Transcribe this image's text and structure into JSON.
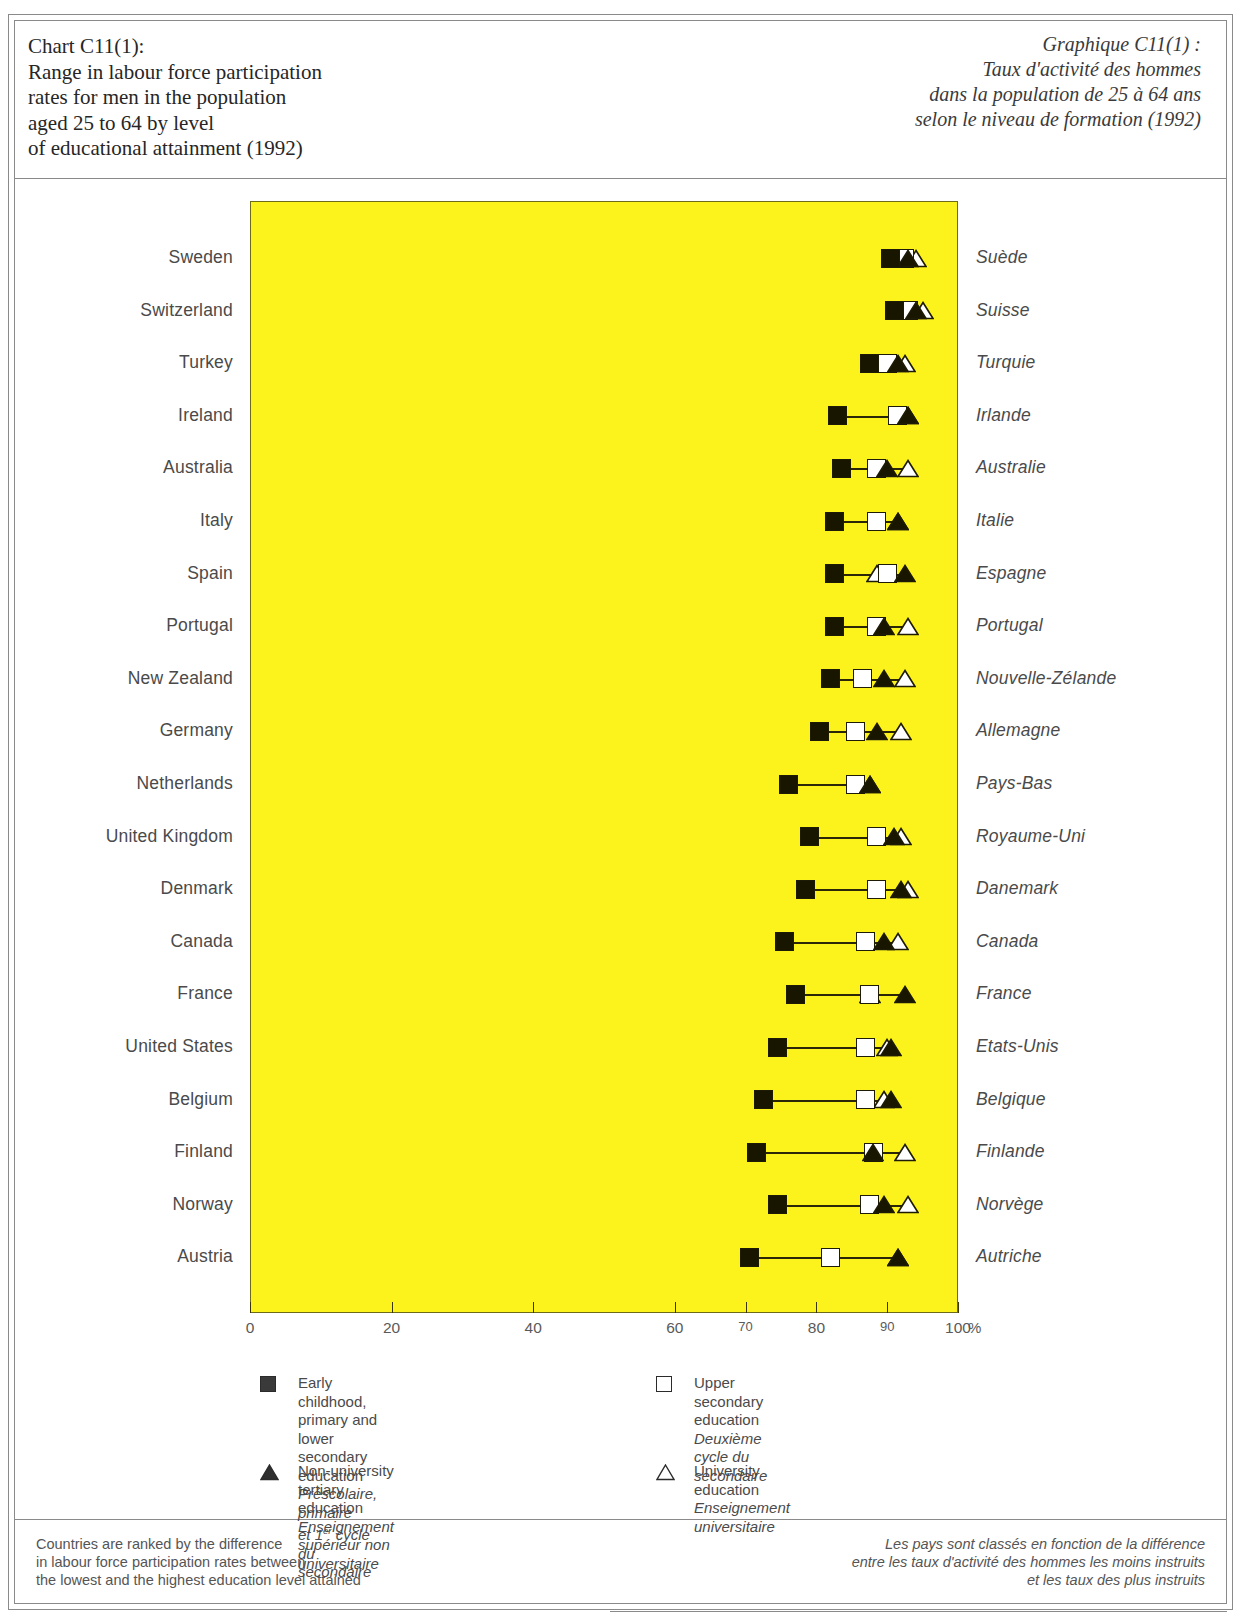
{
  "title_en": "Chart C11(1):\nRange in labour force participation\nrates for men in the population\naged 25 to 64 by level\nof educational attainment (1992)",
  "title_fr": "Graphique C11(1) :\nTaux d'activité des hommes\ndans la population de 25 à 64 ans\nselon le niveau de formation (1992)",
  "axis": {
    "percent_symbol": "%",
    "ticks": [
      {
        "value": 0,
        "label": "0",
        "small": false
      },
      {
        "value": 20,
        "label": "20",
        "small": false
      },
      {
        "value": 40,
        "label": "40",
        "small": false
      },
      {
        "value": 60,
        "label": "60",
        "small": false
      },
      {
        "value": 70,
        "label": "70",
        "small": true
      },
      {
        "value": 80,
        "label": "80",
        "small": false
      },
      {
        "value": 90,
        "label": "90",
        "small": true
      },
      {
        "value": 100,
        "label": "100",
        "small": false
      }
    ]
  },
  "legend": {
    "items": [
      {
        "marker": "filled-square",
        "en": "Early childhood, primary and\nlower secondary education",
        "fr": "Préscolaire, primaire\net 1er cycle du secondaire",
        "fr_sup": "er"
      },
      {
        "marker": "open-square",
        "en": "Upper secondary education",
        "fr": "Deuxième cycle du secondaire"
      },
      {
        "marker": "filled-triangle",
        "en": "Non-university tertiary education",
        "fr": "Enseignement supérieur non universitaire"
      },
      {
        "marker": "open-triangle",
        "en": "University education",
        "fr": "Enseignement universitaire"
      }
    ]
  },
  "note_en": "Countries are ranked by the difference\nin labour force participation rates between\nthe lowest and the highest education level attained",
  "note_fr": "Les pays sont classés en fonction de la différence\nentre les taux d'activité des hommes les moins instruits\net les taux des plus instruits",
  "colors": {
    "plot_background": "#FCF31C",
    "marker_fill": "#191600",
    "marker_open": "#FFFFFF",
    "line": "#2A2607",
    "text": "#4A4A4A"
  },
  "chart_data": {
    "type": "scatter",
    "xlabel": "%",
    "ylabel": "",
    "xlim": [
      0,
      100
    ],
    "grid": false,
    "legend_position": "below",
    "series": [
      {
        "name": "Early childhood, primary and lower secondary education",
        "marker": "filled-square"
      },
      {
        "name": "Upper secondary education",
        "marker": "open-square"
      },
      {
        "name": "Non-university tertiary education",
        "marker": "filled-triangle"
      },
      {
        "name": "University education",
        "marker": "open-triangle"
      }
    ],
    "categories": [
      "Sweden",
      "Switzerland",
      "Turkey",
      "Ireland",
      "Australia",
      "Italy",
      "Spain",
      "Portugal",
      "New Zealand",
      "Germany",
      "Netherlands",
      "United Kingdom",
      "Denmark",
      "Canada",
      "France",
      "United States",
      "Belgium",
      "Finland",
      "Norway",
      "Austria"
    ],
    "categories_fr": [
      "Suède",
      "Suisse",
      "Turquie",
      "Irlande",
      "Australie",
      "Italie",
      "Espagne",
      "Portugal",
      "Nouvelle-Zélande",
      "Allemagne",
      "Pays-Bas",
      "Royaume-Uni",
      "Danemark",
      "Canada",
      "France",
      "Etats-Unis",
      "Belgique",
      "Finlande",
      "Norvège",
      "Autriche"
    ],
    "rows": [
      {
        "country": "Sweden",
        "country_fr": "Suède",
        "lower_secondary": 90.5,
        "upper_secondary": 92.5,
        "non_university": 93.0,
        "university": 94.0
      },
      {
        "country": "Switzerland",
        "country_fr": "Suisse",
        "lower_secondary": 91.0,
        "upper_secondary": 93.0,
        "non_university": 94.0,
        "university": 95.0
      },
      {
        "country": "Turkey",
        "country_fr": "Turquie",
        "lower_secondary": 87.5,
        "upper_secondary": 90.0,
        "non_university": 91.5,
        "university": 92.5
      },
      {
        "country": "Ireland",
        "country_fr": "Irlande",
        "lower_secondary": 83.0,
        "upper_secondary": 91.5,
        "non_university": 93.0,
        "university": 93.0
      },
      {
        "country": "Australia",
        "country_fr": "Australie",
        "lower_secondary": 83.5,
        "upper_secondary": 88.5,
        "non_university": 90.0,
        "university": 93.0
      },
      {
        "country": "Italy",
        "country_fr": "Italie",
        "lower_secondary": 82.5,
        "upper_secondary": 88.5,
        "non_university": 91.5,
        "university": 91.5
      },
      {
        "country": "Spain",
        "country_fr": "Espagne",
        "lower_secondary": 82.5,
        "upper_secondary": 90.0,
        "non_university": 92.5,
        "university": 88.5
      },
      {
        "country": "Portugal",
        "country_fr": "Portugal",
        "lower_secondary": 82.5,
        "upper_secondary": 88.5,
        "non_university": 89.5,
        "university": 93.0
      },
      {
        "country": "New Zealand",
        "country_fr": "Nouvelle-Zélande",
        "lower_secondary": 82.0,
        "upper_secondary": 86.5,
        "non_university": 89.5,
        "university": 92.5
      },
      {
        "country": "Germany",
        "country_fr": "Allemagne",
        "lower_secondary": 80.5,
        "upper_secondary": 85.5,
        "non_university": 88.5,
        "university": 92.0
      },
      {
        "country": "Netherlands",
        "country_fr": "Pays-Bas",
        "lower_secondary": 76.0,
        "upper_secondary": 85.5,
        "non_university": 87.5,
        "university": 87.5
      },
      {
        "country": "United Kingdom",
        "country_fr": "Royaume-Uni",
        "lower_secondary": 79.0,
        "upper_secondary": 88.5,
        "non_university": 91.0,
        "university": 92.0
      },
      {
        "country": "Denmark",
        "country_fr": "Danemark",
        "lower_secondary": 78.5,
        "upper_secondary": 88.5,
        "non_university": 92.0,
        "university": 93.0
      },
      {
        "country": "Canada",
        "country_fr": "Canada",
        "lower_secondary": 75.5,
        "upper_secondary": 87.0,
        "non_university": 89.5,
        "university": 91.5
      },
      {
        "country": "France",
        "country_fr": "France",
        "lower_secondary": 77.0,
        "upper_secondary": 87.5,
        "non_university": 92.5,
        "university": 87.5
      },
      {
        "country": "United States",
        "country_fr": "Etats-Unis",
        "lower_secondary": 74.5,
        "upper_secondary": 87.0,
        "non_university": 90.5,
        "university": 90.0
      },
      {
        "country": "Belgium",
        "country_fr": "Belgique",
        "lower_secondary": 72.5,
        "upper_secondary": 87.0,
        "non_university": 90.5,
        "university": 89.5
      },
      {
        "country": "Finland",
        "country_fr": "Finlande",
        "lower_secondary": 71.5,
        "upper_secondary": 88.0,
        "non_university": 88.0,
        "university": 92.5
      },
      {
        "country": "Norway",
        "country_fr": "Norvège",
        "lower_secondary": 74.5,
        "upper_secondary": 87.5,
        "non_university": 89.5,
        "university": 93.0
      },
      {
        "country": "Austria",
        "country_fr": "Autriche",
        "lower_secondary": 70.5,
        "upper_secondary": 82.0,
        "non_university": 91.5,
        "university": 91.5
      }
    ]
  }
}
